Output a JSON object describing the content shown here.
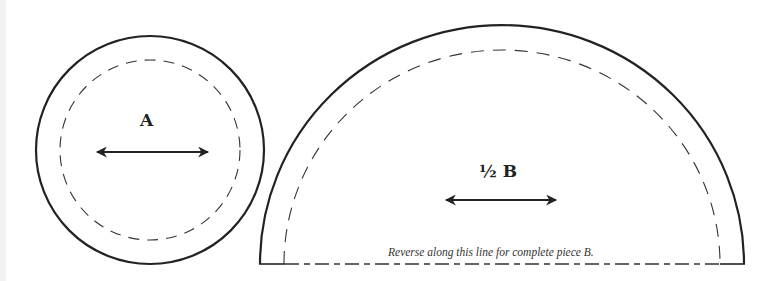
{
  "figure": {
    "type": "sewing-pattern",
    "line_color": "#222222",
    "background": "#ffffff"
  },
  "piece_a": {
    "label": "A",
    "shape": "circle",
    "cut_line": "solid",
    "seam_line": "dashed",
    "grainline": "double-headed-arrow"
  },
  "piece_b": {
    "label": "½ B",
    "shape": "half-circle",
    "cut_line": "solid",
    "seam_line": "dashed",
    "grainline": "double-headed-arrow",
    "fold_note": "Reverse along this line for complete piece B."
  }
}
